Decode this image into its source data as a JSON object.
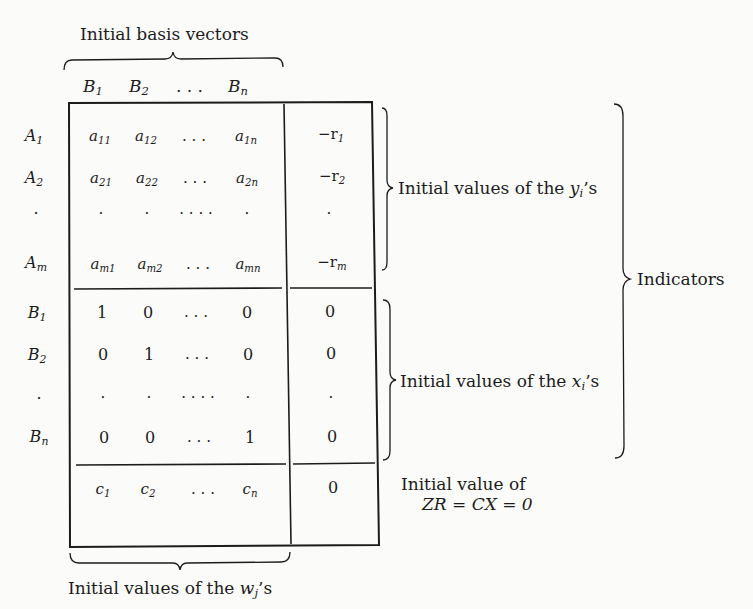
{
  "figure": {
    "top_label": "Initial basis vectors",
    "column_headers": [
      {
        "base": "B",
        "sub": "1"
      },
      {
        "base": "B",
        "sub": "2"
      },
      {
        "base": ". . .",
        "sub": ""
      },
      {
        "base": "B",
        "sub": "n"
      }
    ],
    "row_labels": [
      {
        "base": "A",
        "sub": "1"
      },
      {
        "base": "A",
        "sub": "2"
      },
      {
        "base": "·",
        "sub": ""
      },
      {
        "base": "A",
        "sub": "m"
      },
      {
        "base": "B",
        "sub": "1"
      },
      {
        "base": "B",
        "sub": "2"
      },
      {
        "base": "·",
        "sub": ""
      },
      {
        "base": "B",
        "sub": "n"
      }
    ],
    "matrix_rows": [
      {
        "cells": [
          {
            "b": "a",
            "s": "11"
          },
          {
            "b": "a",
            "s": "12"
          },
          {
            "b": ". . .",
            "s": ""
          },
          {
            "b": "a",
            "s": "1n"
          }
        ],
        "rhs": {
          "b": "−r",
          "s": "1"
        }
      },
      {
        "cells": [
          {
            "b": "a",
            "s": "21"
          },
          {
            "b": "a",
            "s": "22"
          },
          {
            "b": ". . .",
            "s": ""
          },
          {
            "b": "a",
            "s": "2n"
          }
        ],
        "rhs": {
          "b": "−r",
          "s": "2"
        }
      },
      {
        "cells": [
          {
            "b": "·",
            "s": ""
          },
          {
            "b": "·",
            "s": ""
          },
          {
            "b": "· · · ·",
            "s": ""
          },
          {
            "b": "·",
            "s": ""
          }
        ],
        "rhs": {
          "b": "·",
          "s": ""
        }
      },
      {
        "cells": [
          {
            "b": "a",
            "s": "m1"
          },
          {
            "b": "a",
            "s": "m2"
          },
          {
            "b": ". . .",
            "s": ""
          },
          {
            "b": "a",
            "s": "mn"
          }
        ],
        "rhs": {
          "b": "−r",
          "s": "m"
        }
      },
      {
        "cells": [
          {
            "b": "1",
            "s": ""
          },
          {
            "b": "0",
            "s": ""
          },
          {
            "b": ". . .",
            "s": ""
          },
          {
            "b": "0",
            "s": ""
          }
        ],
        "rhs": {
          "b": "0",
          "s": ""
        }
      },
      {
        "cells": [
          {
            "b": "0",
            "s": ""
          },
          {
            "b": "1",
            "s": ""
          },
          {
            "b": ". . .",
            "s": ""
          },
          {
            "b": "0",
            "s": ""
          }
        ],
        "rhs": {
          "b": "0",
          "s": ""
        }
      },
      {
        "cells": [
          {
            "b": "·",
            "s": ""
          },
          {
            "b": "·",
            "s": ""
          },
          {
            "b": "· · · ·",
            "s": ""
          },
          {
            "b": "·",
            "s": ""
          }
        ],
        "rhs": {
          "b": "·",
          "s": ""
        }
      },
      {
        "cells": [
          {
            "b": "0",
            "s": ""
          },
          {
            "b": "0",
            "s": ""
          },
          {
            "b": ". . .",
            "s": ""
          },
          {
            "b": "1",
            "s": ""
          }
        ],
        "rhs": {
          "b": "0",
          "s": ""
        }
      }
    ],
    "cost_row": {
      "cells": [
        {
          "b": "c",
          "s": "1"
        },
        {
          "b": "c",
          "s": "2"
        },
        {
          "b": ". . .",
          "s": ""
        },
        {
          "b": "c",
          "s": "n"
        }
      ],
      "rhs": {
        "b": "0",
        "s": ""
      }
    },
    "annotations": {
      "y_values": {
        "prefix": "Initial values of the ",
        "var": "y",
        "sub": "i",
        "suffix": "’s"
      },
      "x_values": {
        "prefix": "Initial values of the ",
        "var": "x",
        "sub": "i",
        "suffix": "’s"
      },
      "indicators": "Indicators",
      "objective_line1": "Initial value of",
      "objective_line2": "ZR = CX = 0",
      "w_values": {
        "prefix": "Initial values of the ",
        "var": "w",
        "sub": "j",
        "suffix": "’s"
      }
    },
    "colors": {
      "ink": "#1c1c1c",
      "paper": "#fbfbf9"
    }
  }
}
